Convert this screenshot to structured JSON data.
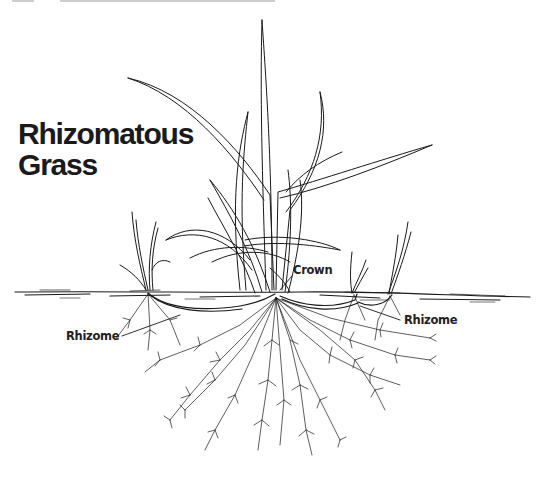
{
  "figure": {
    "title_line1": "Rhizomatous",
    "title_line2": "Grass",
    "labels": {
      "crown": "Crown",
      "rhizome_left": "Rhizome",
      "rhizome_right": "Rhizome"
    },
    "ink_color": "#1a1a1a",
    "background": "#ffffff"
  }
}
